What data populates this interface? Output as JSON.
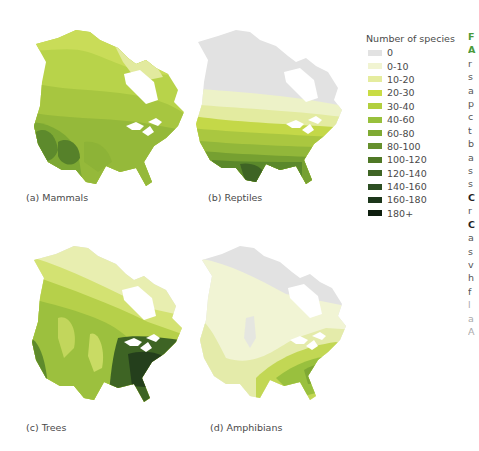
{
  "figure": {
    "panels": [
      {
        "id": "a",
        "label": "(a) Mammals",
        "taxon": "Mammals"
      },
      {
        "id": "b",
        "label": "(b) Reptiles",
        "taxon": "Reptiles"
      },
      {
        "id": "c",
        "label": "(c) Trees",
        "taxon": "Trees"
      },
      {
        "id": "d",
        "label": "(d) Amphibians",
        "taxon": "Amphibians"
      }
    ],
    "region": "North America (Canada, USA)"
  },
  "legend": {
    "title": "Number of species",
    "items": [
      {
        "label": "0",
        "color": "#e2e2e2"
      },
      {
        "label": "0-10",
        "color": "#f1f4d2"
      },
      {
        "label": "10-20",
        "color": "#e5ec9e"
      },
      {
        "label": "20-30",
        "color": "#c9dc44"
      },
      {
        "label": "30-40",
        "color": "#b2cf3e"
      },
      {
        "label": "40-60",
        "color": "#98c03c"
      },
      {
        "label": "60-80",
        "color": "#7faa33"
      },
      {
        "label": "80-100",
        "color": "#66902d"
      },
      {
        "label": "100-120",
        "color": "#4f7826"
      },
      {
        "label": "120-140",
        "color": "#3e6424"
      },
      {
        "label": "140-160",
        "color": "#2c4e22"
      },
      {
        "label": "160-180",
        "color": "#1c361a"
      },
      {
        "label": "180+",
        "color": "#0e1e0e"
      }
    ]
  },
  "caption_fragment": {
    "lines": [
      "F",
      "A",
      "r",
      "s",
      "a",
      "p",
      "c",
      "t",
      "b",
      "a",
      "s",
      "s",
      "C",
      "r",
      "C",
      "a",
      "s",
      "v",
      "h",
      "f",
      "l",
      "a",
      "A"
    ]
  },
  "chart_data": {
    "type": "heatmap",
    "legend_title": "Number of species",
    "bins": [
      "0",
      "0-10",
      "10-20",
      "20-30",
      "30-40",
      "40-60",
      "60-80",
      "80-100",
      "100-120",
      "120-140",
      "140-160",
      "160-180",
      "180+"
    ],
    "panels": [
      {
        "label": "(a) Mammals",
        "pattern": "Highest (~100-140) in western/southwestern USA mountains; 20-40 across Canada; 10-20 in high Arctic",
        "range_observed": [
          "10-20",
          "120-140"
        ]
      },
      {
        "label": "(b) Reptiles",
        "pattern": "0 in northern Canada/Arctic; 0-10 across southern Canada; increasing southward to 100-120 in Texas/Southeast USA",
        "range_observed": [
          "0",
          "100-120"
        ]
      },
      {
        "label": "(c) Trees",
        "pattern": "10-20 in far north; 40-80 across west; highest (140-180) in southeastern USA",
        "range_observed": [
          "0",
          "160-180"
        ]
      },
      {
        "label": "(d) Amphibians",
        "pattern": "0 in Arctic; 0-10 across most of Canada/west; highest (40-60) in southeastern USA",
        "range_observed": [
          "0",
          "40-60"
        ]
      }
    ]
  }
}
